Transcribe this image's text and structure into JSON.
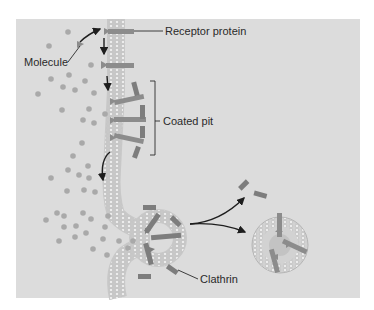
{
  "diagram": {
    "colors": {
      "panel_background": "#dcdcdc",
      "page_background": "#ffffff",
      "molecule_dot": "#a9a9a9",
      "membrane_stroke": "#b4b4b4",
      "membrane_fill": "#e6e6e6",
      "protein": "#8c8c8c",
      "clathrin": "#7d7d7d",
      "arrow": "#1e1e1e",
      "text": "#2a2a2a"
    },
    "labels": {
      "molecule": "Molecule",
      "receptor_protein": "Receptor protein",
      "coated_pit": "Coated pit",
      "clathrin": "Clathrin"
    },
    "stages": [
      "Molecule binds receptor protein",
      "Receptors migrate to coated pit",
      "Membrane invaginates",
      "Coated vesicle pinches off",
      "Clathrin coat released"
    ]
  }
}
